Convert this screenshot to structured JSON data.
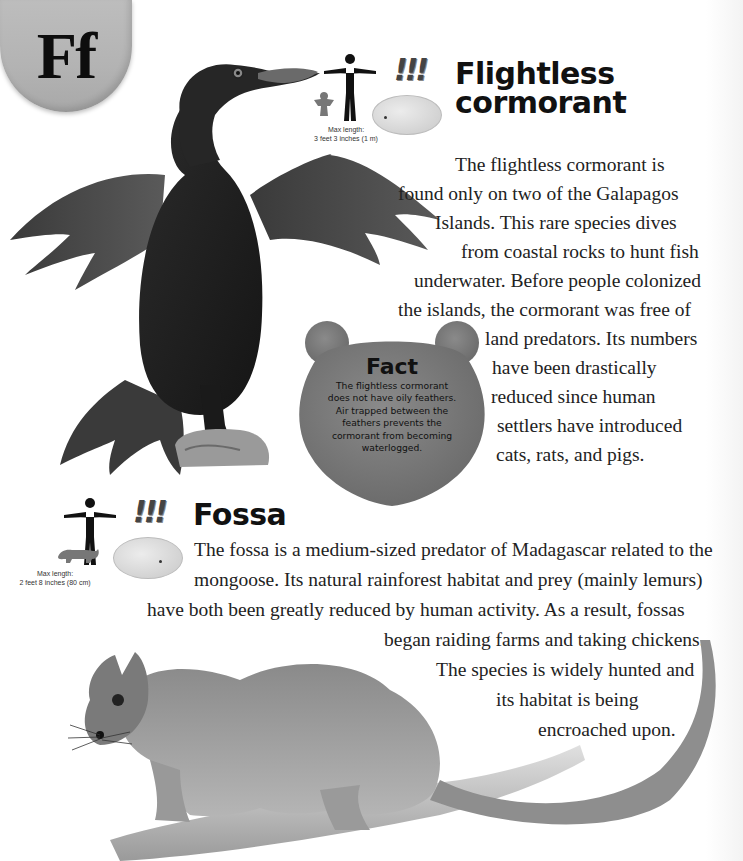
{
  "page": {
    "letter_tab": "Ff",
    "background_color": "#ffffff"
  },
  "entries": [
    {
      "id": "flightless-cormorant",
      "title_lines": [
        "Flightless",
        "cormorant"
      ],
      "danger_marker": "!!!",
      "size_caption": [
        "Max length:",
        "3 feet 3 inches (1 m)"
      ],
      "body_lines": [
        "The flightless cormorant is",
        "found only on two of the Galapagos",
        "Islands. This rare species dives",
        "from coastal rocks to hunt fish",
        "underwater. Before people colonized",
        "the islands, the cormorant was free of",
        "land predators. Its numbers",
        "have been drastically",
        "reduced since human",
        "settlers have introduced",
        "cats, rats, and pigs."
      ],
      "fact": {
        "title": "Fact",
        "lines": [
          "The flightless cormorant",
          "does not have oily feathers.",
          "Air trapped between the",
          "feathers prevents the",
          "cormorant from becoming",
          "waterlogged."
        ]
      },
      "illustration": "flightless-cormorant-illustration"
    },
    {
      "id": "fossa",
      "title": "Fossa",
      "danger_marker": "!!!",
      "size_caption": [
        "Max length:",
        "2 feet 8 inches (80 cm)"
      ],
      "body_lines": [
        "The fossa is a medium-sized predator of Madagascar related to the",
        "mongoose. Its natural rainforest habitat and prey (mainly lemurs)",
        "have both been greatly reduced by human activity. As a result, fossas",
        "began raiding farms and taking chickens.",
        "The species is widely hunted and",
        "its habitat is being",
        "encroached upon."
      ],
      "illustration": "fossa-illustration"
    }
  ]
}
